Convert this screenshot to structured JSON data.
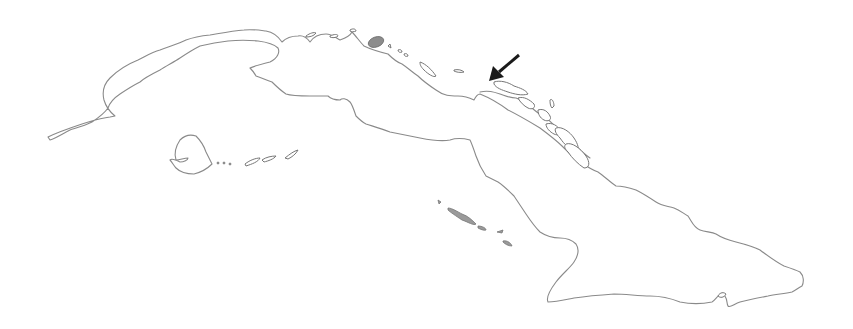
{
  "map": {
    "subject": "Cuba outline",
    "style": "grayscale coastline line drawing",
    "colors": {
      "background": "#ffffff",
      "coastline": "#8a8a8a",
      "arrow": "#1a1a1a",
      "shaded_feature": "#8c8c8c"
    },
    "features": [
      {
        "name": "cuba-main-island",
        "type": "coastline"
      },
      {
        "name": "isla-de-la-juventud",
        "type": "island"
      },
      {
        "name": "canarreos-archipelago",
        "type": "cays"
      },
      {
        "name": "sabana-camaguey-archipelago",
        "type": "cays"
      },
      {
        "name": "jardines-de-la-reina",
        "type": "cays"
      },
      {
        "name": "shaded-bay-feature",
        "type": "shaded-area"
      }
    ],
    "annotation": {
      "type": "arrow",
      "from": [
        519,
        55
      ],
      "to": [
        489,
        81
      ],
      "points_to": "north-coast location"
    }
  }
}
